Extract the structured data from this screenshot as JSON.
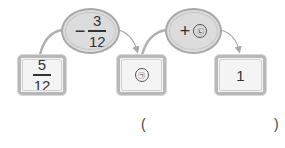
{
  "diagram": {
    "start": {
      "numerator": "5",
      "denominator": "12"
    },
    "step1": {
      "operator": "−",
      "numerator": "3",
      "denominator": "12"
    },
    "middle": {
      "label": "㉠"
    },
    "step2": {
      "operator": "+",
      "label": "㉡"
    },
    "end": {
      "value": "1"
    }
  },
  "answer": {
    "open_paren": "(",
    "close_paren": ")",
    "value": ""
  },
  "colors": {
    "box_border": "#b8b8b8",
    "ellipse_fill": "#dcdcdc",
    "arrow": "#a8a8a8"
  }
}
